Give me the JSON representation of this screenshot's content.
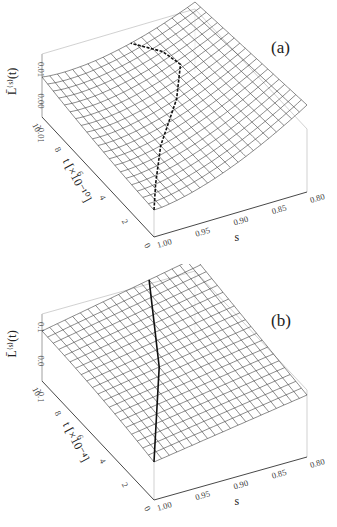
{
  "figure": {
    "panels": [
      {
        "id": "a",
        "label": "(a)",
        "zlabel": "L̄⁽ˢ⁾(t)",
        "zticks": [
          "0.01",
          "0.00",
          "-0.01"
        ],
        "ylabel": "t [×10⁻¹⁰]",
        "yticks": [
          "0",
          "2",
          "4",
          "6",
          "8",
          "10"
        ],
        "xlabel": "s",
        "xticks": [
          "1.00",
          "0.95",
          "0.90",
          "0.85",
          "0.80"
        ]
      },
      {
        "id": "b",
        "label": "(b)",
        "zlabel": "L̄⁽ˢ⁾(t)",
        "zticks": [
          "0.1",
          "0.0",
          "-0.1"
        ],
        "ylabel": "t [×10⁻⁴]",
        "yticks": [
          "0",
          "2",
          "4",
          "6",
          "8",
          "10"
        ],
        "xlabel": "s",
        "xticks": [
          "1.00",
          "0.95",
          "0.90",
          "0.85",
          "0.80"
        ]
      }
    ]
  },
  "chart_data": [
    {
      "type": "surface",
      "title": "(a)",
      "xlabel": "s",
      "ylabel": "t [×10^-10]",
      "zlabel": "L̄^(s)(t)",
      "x_range": [
        0.8,
        1.0
      ],
      "y_range": [
        0,
        10
      ],
      "z_ticks": [
        -0.01,
        0.0,
        0.01
      ],
      "x_ticks": [
        1.0,
        0.95,
        0.9,
        0.85,
        0.8
      ],
      "y_ticks": [
        0,
        2,
        4,
        6,
        8,
        10
      ],
      "description": "Wireframe surface, concave-up saddle-like valley; minimum near t≈0 at s=1.00, rising toward s=0.80; dashed curve marks the minimum path curving from (s=1.00,t≈0) through s≈0.85 back toward t=10.",
      "grid_lines": 20,
      "overlay_curve": {
        "style": "dashed",
        "path_s": [
          1.0,
          0.95,
          0.9,
          0.87,
          0.86,
          0.87,
          0.89
        ],
        "path_t": [
          0,
          2,
          4,
          6,
          7,
          8.5,
          10
        ]
      }
    },
    {
      "type": "surface",
      "title": "(b)",
      "xlabel": "s",
      "ylabel": "t [×10^-4]",
      "zlabel": "L̄^(s)(t)",
      "x_range": [
        0.8,
        1.0
      ],
      "y_range": [
        0,
        10
      ],
      "z_ticks": [
        -0.1,
        0.0,
        0.1
      ],
      "x_ticks": [
        1.0,
        0.95,
        0.9,
        0.85,
        0.8
      ],
      "y_ticks": [
        0,
        2,
        4,
        6,
        8,
        10
      ],
      "description": "Wireframe surface, nearly planar tilted, increasing toward large t and small s; solid curve from (s=1.00,t=0) to (s≈0.86,t=10).",
      "grid_lines": 20,
      "overlay_curve": {
        "style": "solid",
        "path_s": [
          1.0,
          0.96,
          0.92,
          0.89,
          0.86
        ],
        "path_t": [
          0,
          2.5,
          5,
          7.5,
          10
        ]
      }
    }
  ]
}
